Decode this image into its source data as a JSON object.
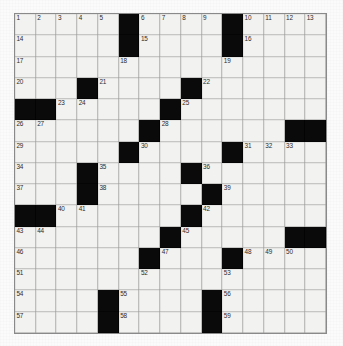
{
  "puzzle": {
    "title": "Crossword Grid",
    "rows": 15,
    "columns": 15,
    "colors": {
      "block": "#0a0a0a",
      "cell": "#f2f2f0",
      "grid_line": "#8a8a8a",
      "number_text": "#2b2b2b",
      "page_background": "#fbfbfb"
    },
    "grid": [
      [
        {
          "block": false,
          "number": "1"
        },
        {
          "block": false,
          "number": "2"
        },
        {
          "block": false,
          "number": "3"
        },
        {
          "block": false,
          "number": "4"
        },
        {
          "block": false,
          "number": "5"
        },
        {
          "block": true,
          "number": ""
        },
        {
          "block": false,
          "number": "6"
        },
        {
          "block": false,
          "number": "7"
        },
        {
          "block": false,
          "number": "8"
        },
        {
          "block": false,
          "number": "9"
        },
        {
          "block": true,
          "number": ""
        },
        {
          "block": false,
          "number": "10"
        },
        {
          "block": false,
          "number": "11"
        },
        {
          "block": false,
          "number": "12"
        },
        {
          "block": false,
          "number": "13"
        }
      ],
      [
        {
          "block": false,
          "number": "14"
        },
        {
          "block": false,
          "number": ""
        },
        {
          "block": false,
          "number": ""
        },
        {
          "block": false,
          "number": ""
        },
        {
          "block": false,
          "number": ""
        },
        {
          "block": true,
          "number": ""
        },
        {
          "block": false,
          "number": "15"
        },
        {
          "block": false,
          "number": ""
        },
        {
          "block": false,
          "number": ""
        },
        {
          "block": false,
          "number": ""
        },
        {
          "block": true,
          "number": ""
        },
        {
          "block": false,
          "number": "16"
        },
        {
          "block": false,
          "number": ""
        },
        {
          "block": false,
          "number": ""
        },
        {
          "block": false,
          "number": ""
        }
      ],
      [
        {
          "block": false,
          "number": "17"
        },
        {
          "block": false,
          "number": ""
        },
        {
          "block": false,
          "number": ""
        },
        {
          "block": false,
          "number": ""
        },
        {
          "block": false,
          "number": ""
        },
        {
          "block": false,
          "number": "18"
        },
        {
          "block": false,
          "number": ""
        },
        {
          "block": false,
          "number": ""
        },
        {
          "block": false,
          "number": ""
        },
        {
          "block": false,
          "number": ""
        },
        {
          "block": false,
          "number": "19"
        },
        {
          "block": false,
          "number": ""
        },
        {
          "block": false,
          "number": ""
        },
        {
          "block": false,
          "number": ""
        },
        {
          "block": false,
          "number": ""
        }
      ],
      [
        {
          "block": false,
          "number": "20"
        },
        {
          "block": false,
          "number": ""
        },
        {
          "block": false,
          "number": ""
        },
        {
          "block": true,
          "number": ""
        },
        {
          "block": false,
          "number": "21"
        },
        {
          "block": false,
          "number": ""
        },
        {
          "block": false,
          "number": ""
        },
        {
          "block": false,
          "number": ""
        },
        {
          "block": true,
          "number": ""
        },
        {
          "block": false,
          "number": "22"
        },
        {
          "block": false,
          "number": ""
        },
        {
          "block": false,
          "number": ""
        },
        {
          "block": false,
          "number": ""
        },
        {
          "block": false,
          "number": ""
        },
        {
          "block": false,
          "number": ""
        }
      ],
      [
        {
          "block": true,
          "number": ""
        },
        {
          "block": true,
          "number": ""
        },
        {
          "block": false,
          "number": "23"
        },
        {
          "block": false,
          "number": "24"
        },
        {
          "block": false,
          "number": ""
        },
        {
          "block": false,
          "number": ""
        },
        {
          "block": false,
          "number": ""
        },
        {
          "block": true,
          "number": ""
        },
        {
          "block": false,
          "number": "25"
        },
        {
          "block": false,
          "number": ""
        },
        {
          "block": false,
          "number": ""
        },
        {
          "block": false,
          "number": ""
        },
        {
          "block": false,
          "number": ""
        },
        {
          "block": false,
          "number": ""
        },
        {
          "block": false,
          "number": ""
        }
      ],
      [
        {
          "block": false,
          "number": "26"
        },
        {
          "block": false,
          "number": "27"
        },
        {
          "block": false,
          "number": ""
        },
        {
          "block": false,
          "number": ""
        },
        {
          "block": false,
          "number": ""
        },
        {
          "block": false,
          "number": ""
        },
        {
          "block": true,
          "number": ""
        },
        {
          "block": false,
          "number": "28"
        },
        {
          "block": false,
          "number": ""
        },
        {
          "block": false,
          "number": ""
        },
        {
          "block": false,
          "number": ""
        },
        {
          "block": false,
          "number": ""
        },
        {
          "block": false,
          "number": ""
        },
        {
          "block": true,
          "number": ""
        },
        {
          "block": true,
          "number": ""
        }
      ],
      [
        {
          "block": false,
          "number": "29"
        },
        {
          "block": false,
          "number": ""
        },
        {
          "block": false,
          "number": ""
        },
        {
          "block": false,
          "number": ""
        },
        {
          "block": false,
          "number": ""
        },
        {
          "block": true,
          "number": ""
        },
        {
          "block": false,
          "number": "30"
        },
        {
          "block": false,
          "number": ""
        },
        {
          "block": false,
          "number": ""
        },
        {
          "block": false,
          "number": ""
        },
        {
          "block": true,
          "number": ""
        },
        {
          "block": false,
          "number": "31"
        },
        {
          "block": false,
          "number": "32"
        },
        {
          "block": false,
          "number": "33"
        },
        {
          "block": false,
          "number": ""
        }
      ],
      [
        {
          "block": false,
          "number": "34"
        },
        {
          "block": false,
          "number": ""
        },
        {
          "block": false,
          "number": ""
        },
        {
          "block": true,
          "number": ""
        },
        {
          "block": false,
          "number": "35"
        },
        {
          "block": false,
          "number": ""
        },
        {
          "block": false,
          "number": ""
        },
        {
          "block": false,
          "number": ""
        },
        {
          "block": true,
          "number": ""
        },
        {
          "block": false,
          "number": "36"
        },
        {
          "block": false,
          "number": ""
        },
        {
          "block": false,
          "number": ""
        },
        {
          "block": false,
          "number": ""
        },
        {
          "block": false,
          "number": ""
        },
        {
          "block": false,
          "number": ""
        }
      ],
      [
        {
          "block": false,
          "number": "37"
        },
        {
          "block": false,
          "number": ""
        },
        {
          "block": false,
          "number": ""
        },
        {
          "block": true,
          "number": ""
        },
        {
          "block": false,
          "number": "38"
        },
        {
          "block": false,
          "number": ""
        },
        {
          "block": false,
          "number": ""
        },
        {
          "block": false,
          "number": ""
        },
        {
          "block": false,
          "number": ""
        },
        {
          "block": true,
          "number": ""
        },
        {
          "block": false,
          "number": "39"
        },
        {
          "block": false,
          "number": ""
        },
        {
          "block": false,
          "number": ""
        },
        {
          "block": false,
          "number": ""
        },
        {
          "block": false,
          "number": ""
        }
      ],
      [
        {
          "block": true,
          "number": ""
        },
        {
          "block": true,
          "number": ""
        },
        {
          "block": false,
          "number": "40"
        },
        {
          "block": false,
          "number": "41"
        },
        {
          "block": false,
          "number": ""
        },
        {
          "block": false,
          "number": ""
        },
        {
          "block": false,
          "number": ""
        },
        {
          "block": false,
          "number": ""
        },
        {
          "block": true,
          "number": ""
        },
        {
          "block": false,
          "number": "42"
        },
        {
          "block": false,
          "number": ""
        },
        {
          "block": false,
          "number": ""
        },
        {
          "block": false,
          "number": ""
        },
        {
          "block": false,
          "number": ""
        },
        {
          "block": false,
          "number": ""
        }
      ],
      [
        {
          "block": false,
          "number": "43"
        },
        {
          "block": false,
          "number": "44"
        },
        {
          "block": false,
          "number": ""
        },
        {
          "block": false,
          "number": ""
        },
        {
          "block": false,
          "number": ""
        },
        {
          "block": false,
          "number": ""
        },
        {
          "block": false,
          "number": ""
        },
        {
          "block": true,
          "number": ""
        },
        {
          "block": false,
          "number": "45"
        },
        {
          "block": false,
          "number": ""
        },
        {
          "block": false,
          "number": ""
        },
        {
          "block": false,
          "number": ""
        },
        {
          "block": false,
          "number": ""
        },
        {
          "block": true,
          "number": ""
        },
        {
          "block": true,
          "number": ""
        }
      ],
      [
        {
          "block": false,
          "number": "46"
        },
        {
          "block": false,
          "number": ""
        },
        {
          "block": false,
          "number": ""
        },
        {
          "block": false,
          "number": ""
        },
        {
          "block": false,
          "number": ""
        },
        {
          "block": false,
          "number": ""
        },
        {
          "block": true,
          "number": ""
        },
        {
          "block": false,
          "number": "47"
        },
        {
          "block": false,
          "number": ""
        },
        {
          "block": false,
          "number": ""
        },
        {
          "block": true,
          "number": ""
        },
        {
          "block": false,
          "number": "48"
        },
        {
          "block": false,
          "number": "49"
        },
        {
          "block": false,
          "number": "50"
        },
        {
          "block": false,
          "number": ""
        }
      ],
      [
        {
          "block": false,
          "number": "51"
        },
        {
          "block": false,
          "number": ""
        },
        {
          "block": false,
          "number": ""
        },
        {
          "block": false,
          "number": ""
        },
        {
          "block": false,
          "number": ""
        },
        {
          "block": false,
          "number": ""
        },
        {
          "block": false,
          "number": "52"
        },
        {
          "block": false,
          "number": ""
        },
        {
          "block": false,
          "number": ""
        },
        {
          "block": false,
          "number": ""
        },
        {
          "block": false,
          "number": "53"
        },
        {
          "block": false,
          "number": ""
        },
        {
          "block": false,
          "number": ""
        },
        {
          "block": false,
          "number": ""
        },
        {
          "block": false,
          "number": ""
        }
      ],
      [
        {
          "block": false,
          "number": "54"
        },
        {
          "block": false,
          "number": ""
        },
        {
          "block": false,
          "number": ""
        },
        {
          "block": false,
          "number": ""
        },
        {
          "block": true,
          "number": ""
        },
        {
          "block": false,
          "number": "55"
        },
        {
          "block": false,
          "number": ""
        },
        {
          "block": false,
          "number": ""
        },
        {
          "block": false,
          "number": ""
        },
        {
          "block": true,
          "number": ""
        },
        {
          "block": false,
          "number": "56"
        },
        {
          "block": false,
          "number": ""
        },
        {
          "block": false,
          "number": ""
        },
        {
          "block": false,
          "number": ""
        },
        {
          "block": false,
          "number": ""
        }
      ],
      [
        {
          "block": false,
          "number": "57"
        },
        {
          "block": false,
          "number": ""
        },
        {
          "block": false,
          "number": ""
        },
        {
          "block": false,
          "number": ""
        },
        {
          "block": true,
          "number": ""
        },
        {
          "block": false,
          "number": "58"
        },
        {
          "block": false,
          "number": ""
        },
        {
          "block": false,
          "number": ""
        },
        {
          "block": false,
          "number": ""
        },
        {
          "block": true,
          "number": ""
        },
        {
          "block": false,
          "number": "59"
        },
        {
          "block": false,
          "number": ""
        },
        {
          "block": false,
          "number": ""
        },
        {
          "block": false,
          "number": ""
        },
        {
          "block": false,
          "number": ""
        }
      ]
    ]
  }
}
